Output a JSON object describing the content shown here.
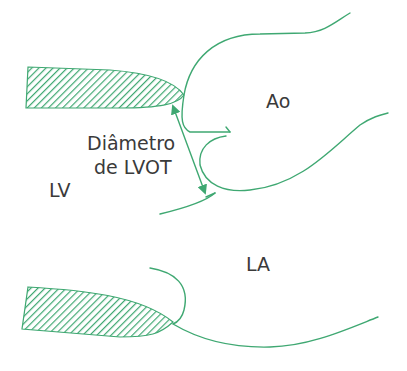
{
  "diagram": {
    "labels": {
      "aorta": "Ao",
      "left_ventricle": "LV",
      "left_atrium": "LA",
      "measurement_line1": "Diâmetro",
      "measurement_line2": "de LVOT"
    },
    "colors": {
      "stroke": "#3fa872",
      "hatch": "#3fa872",
      "text": "#3a3a3a",
      "background": "#ffffff"
    }
  }
}
